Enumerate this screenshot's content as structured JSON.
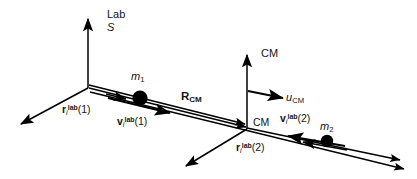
{
  "figure": {
    "stroke_color": "#000000",
    "mass_color": "#000000",
    "background": "#ffffff"
  },
  "labels": {
    "lab_frame_line1": "Lab",
    "lab_frame_line2": "S",
    "cm_axis": "CM",
    "cm_origin": "CM",
    "mass1_symbol": "m",
    "mass1_index": "1",
    "mass2_symbol": "m",
    "mass2_index": "2",
    "r_cm_symbol": "R",
    "r_cm_subscript": "CM",
    "u_cm_symbol": "u",
    "u_cm_subscript": "CM",
    "r_vector_symbol": "r",
    "v_vector_symbol": "v",
    "vector_subscript": "i",
    "vector_superscript": "lab",
    "particle1_arg": "(1)",
    "particle2_arg": "(2)"
  },
  "elements": {
    "lab_vertical_axis": "lab-frame-vertical-axis",
    "lab_diagonal_axis": "lab-frame-diagonal-axis",
    "cm_vertical_axis": "cm-frame-vertical-axis",
    "cm_diagonal_axis": "cm-frame-diagonal-axis",
    "mass1_marker": "mass-1-marker",
    "mass2_marker": "mass-2-marker",
    "r_cm_vector": "r-cm-vector",
    "u_cm_vector": "u-cm-vector",
    "r1_vector": "r-lab-1-vector",
    "r2_vector": "r-lab-2-vector",
    "v1_vector": "v-lab-1-vector",
    "v2_vector": "v-lab-2-vector"
  }
}
